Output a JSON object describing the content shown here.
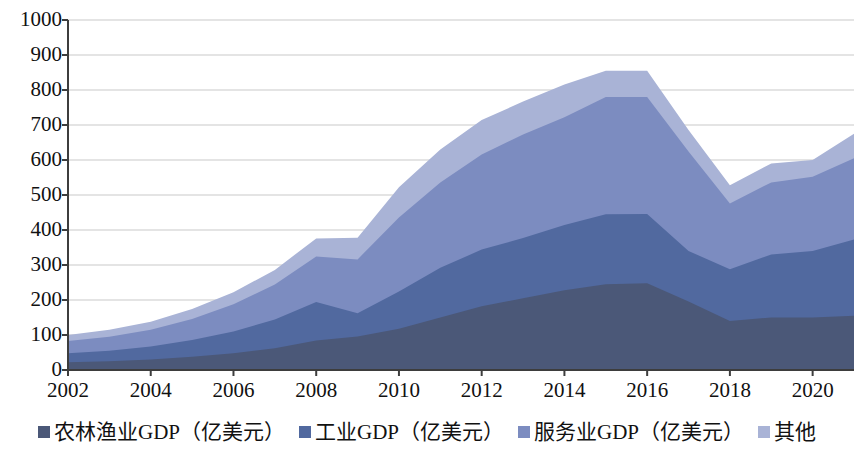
{
  "chart_data": {
    "type": "area",
    "stacked": true,
    "title": "",
    "subtitle": "",
    "xlabel": "",
    "ylabel": "",
    "xlim": [
      2002,
      2021
    ],
    "ylim": [
      0,
      1000
    ],
    "grid": true,
    "legend_position": "bottom",
    "x": [
      2002,
      2003,
      2004,
      2005,
      2006,
      2007,
      2008,
      2009,
      2010,
      2011,
      2012,
      2013,
      2014,
      2015,
      2016,
      2017,
      2018,
      2019,
      2020,
      2021
    ],
    "x_tick_labels": [
      "2002",
      "2004",
      "2006",
      "2008",
      "2010",
      "2012",
      "2014",
      "2016",
      "2018",
      "2020"
    ],
    "x_ticks": [
      2002,
      2004,
      2006,
      2008,
      2010,
      2012,
      2014,
      2016,
      2018,
      2020
    ],
    "y_tick_labels": [
      "0",
      "100",
      "200",
      "300",
      "400",
      "500",
      "600",
      "700",
      "800",
      "900",
      "1000"
    ],
    "y_ticks": [
      0,
      100,
      200,
      300,
      400,
      500,
      600,
      700,
      800,
      900,
      1000
    ],
    "series": [
      {
        "name": "农林渔业GDP（亿美元）",
        "color": "#4b5878",
        "values": [
          22,
          25,
          30,
          38,
          48,
          62,
          84,
          96,
          118,
          150,
          182,
          205,
          228,
          245,
          248,
          196,
          140,
          150,
          150,
          155
        ]
      },
      {
        "name": "工业GDP（亿美元）",
        "color": "#51699f",
        "values": [
          26,
          30,
          37,
          48,
          62,
          82,
          110,
          66,
          106,
          142,
          162,
          172,
          186,
          200,
          198,
          144,
          148,
          180,
          190,
          218
        ]
      },
      {
        "name": "服务业GDP（亿美元）",
        "color": "#7c8cc0",
        "values": [
          35,
          40,
          48,
          60,
          78,
          100,
          130,
          154,
          212,
          244,
          272,
          296,
          308,
          335,
          334,
          284,
          188,
          206,
          212,
          232
        ]
      },
      {
        "name": "其他",
        "color": "#a9b3d6",
        "values": [
          17,
          20,
          23,
          28,
          34,
          42,
          52,
          62,
          86,
          94,
          98,
          94,
          94,
          75,
          75,
          62,
          52,
          54,
          48,
          70
        ]
      }
    ],
    "totals": [
      100,
      115,
      138,
      174,
      222,
      286,
      376,
      378,
      522,
      630,
      714,
      767,
      816,
      855,
      855,
      686,
      528,
      590,
      600,
      675
    ]
  },
  "axis": {
    "line_color": "#3d3d3d",
    "grid_color": "#c9c9c9",
    "plot_bg": "#ffffff"
  },
  "legend": {
    "items": [
      {
        "label": "农林渔业GDP（亿美元）",
        "swatch": "legend-swatch-agriculture",
        "color": "#4b5878"
      },
      {
        "label": "工业GDP（亿美元）",
        "swatch": "legend-swatch-industry",
        "color": "#51699f"
      },
      {
        "label": "服务业GDP（亿美元）",
        "swatch": "legend-swatch-services",
        "color": "#7c8cc0"
      },
      {
        "label": "其他",
        "swatch": "legend-swatch-other",
        "color": "#a9b3d6"
      }
    ]
  }
}
